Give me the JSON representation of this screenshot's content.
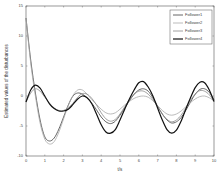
{
  "chart_data": {
    "type": "line",
    "title": "",
    "xlabel": "t/s",
    "ylabel": "Estimated values of the disturbances",
    "xlim": [
      0,
      10
    ],
    "ylim": [
      -10,
      15
    ],
    "xticks": [
      0,
      1,
      2,
      3,
      4,
      5,
      6,
      7,
      8,
      9,
      10
    ],
    "yticks": [
      -10,
      -5,
      0,
      5,
      10,
      15
    ],
    "grid": false,
    "legend_position": "upper right",
    "x": [
      0,
      0.25,
      0.5,
      0.75,
      1,
      1.25,
      1.5,
      1.75,
      2,
      2.25,
      2.5,
      2.75,
      3,
      3.25,
      3.5,
      3.75,
      4,
      4.25,
      4.5,
      4.75,
      5,
      5.25,
      5.5,
      5.75,
      6,
      6.25,
      6.5,
      6.75,
      7,
      7.25,
      7.5,
      7.75,
      8,
      8.25,
      8.5,
      8.75,
      9,
      9.25,
      9.5,
      9.75,
      10
    ],
    "series": [
      {
        "name": "Follower1",
        "color": "#555555",
        "width": 0.9,
        "values": [
          13,
          6,
          0.5,
          -4,
          -6.8,
          -7.5,
          -7,
          -5.5,
          -3.5,
          -1.5,
          0,
          0.5,
          0.3,
          -0.3,
          -1.2,
          -2.3,
          -3.5,
          -4.3,
          -4.6,
          -4.2,
          -3.2,
          -2,
          -0.8,
          0.3,
          1,
          1.2,
          0.8,
          -0.3,
          -1.7,
          -3,
          -4,
          -4.5,
          -4.3,
          -3.6,
          -2.4,
          -1,
          0.3,
          1.1,
          1.2,
          0.6,
          -0.6
        ]
      },
      {
        "name": "Follower2",
        "color": "#aaaaaa",
        "width": 0.8,
        "values": [
          13,
          5.5,
          0,
          -4.5,
          -7.2,
          -8,
          -7.6,
          -6,
          -3.8,
          -1.6,
          0.1,
          1,
          1,
          0.3,
          -0.6,
          -1.4,
          -2.2,
          -2.8,
          -3,
          -2.8,
          -2.2,
          -1.5,
          -0.9,
          -0.4,
          -0.1,
          0,
          -0.2,
          -0.8,
          -1.6,
          -2.4,
          -3,
          -3.2,
          -3,
          -2.5,
          -1.8,
          -1.1,
          -0.5,
          -0.1,
          0,
          -0.3,
          -0.8
        ]
      },
      {
        "name": "Follower3",
        "color": "#888888",
        "width": 0.8,
        "values": [
          -1,
          0.5,
          1.2,
          0.8,
          -0.2,
          -1.2,
          -2,
          -2.4,
          -2.4,
          -2,
          -1.2,
          -0.2,
          0.4,
          0.3,
          -0.4,
          -1.5,
          -2.8,
          -3.8,
          -4.2,
          -3.9,
          -3,
          -1.8,
          -0.6,
          0.3,
          0.8,
          0.8,
          0.3,
          -0.6,
          -1.8,
          -3,
          -3.9,
          -4.3,
          -4,
          -3.2,
          -2,
          -0.7,
          0.3,
          0.9,
          0.8,
          0.2,
          -0.9
        ]
      },
      {
        "name": "Follower4",
        "color": "#111111",
        "width": 1.2,
        "values": [
          -1,
          1,
          1.8,
          1.3,
          0,
          -1.3,
          -2.1,
          -2.5,
          -2.5,
          -2.2,
          -1.4,
          -0.5,
          0,
          -0.3,
          -1.3,
          -3,
          -4.8,
          -6,
          -6.2,
          -5.6,
          -4,
          -2.2,
          -0.5,
          1,
          2.2,
          2.4,
          1.5,
          0,
          -2,
          -4,
          -5.6,
          -6.2,
          -5.7,
          -4.2,
          -2.2,
          -0.3,
          1.4,
          2.3,
          2.2,
          1,
          -0.9
        ]
      }
    ]
  },
  "legend": {
    "items": [
      "Follower1",
      "Follower2",
      "Follower3",
      "Follower4"
    ]
  },
  "axes": {
    "xlabel": "t/s",
    "ylabel": "Estimated values of the disturbances",
    "xtick_labels": [
      "0",
      "1",
      "2",
      "3",
      "4",
      "5",
      "6",
      "7",
      "8",
      "9",
      "10"
    ],
    "ytick_labels": [
      "-10",
      "-5",
      "0",
      "5",
      "10",
      "15"
    ]
  }
}
